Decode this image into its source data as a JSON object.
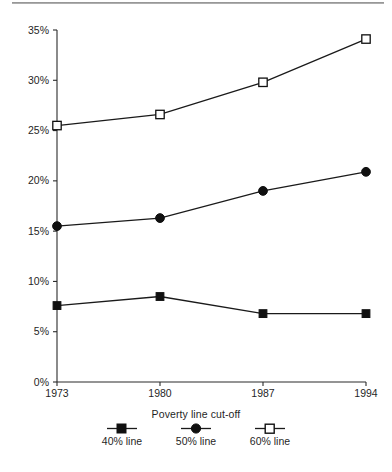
{
  "chart_data": {
    "type": "line",
    "title": "",
    "subtitle": "",
    "xlabel": "",
    "ylabel": "",
    "x": [
      1973,
      1980,
      1987,
      1994
    ],
    "categories": [
      "1973",
      "1980",
      "1987",
      "1994"
    ],
    "xtick_labels": [
      "1973",
      "1980",
      "1987",
      "1994"
    ],
    "ytick_labels": [
      "0%",
      "5%",
      "10%",
      "15%",
      "20%",
      "25%",
      "30%",
      "35%"
    ],
    "ytick_values": [
      0,
      5,
      10,
      15,
      20,
      25,
      30,
      35
    ],
    "ylim": [
      0,
      35
    ],
    "grid": false,
    "legend_position": "bottom",
    "legend_title": "Poverty line cut-off",
    "series": [
      {
        "name": "40% line",
        "marker": "filled-square",
        "values": [
          7.6,
          8.5,
          6.8,
          6.8
        ]
      },
      {
        "name": "50% line",
        "marker": "filled-circle",
        "values": [
          15.5,
          16.3,
          19.0,
          20.9
        ]
      },
      {
        "name": "60% line",
        "marker": "open-square",
        "values": [
          25.5,
          26.6,
          29.8,
          34.1
        ]
      }
    ],
    "colors": {
      "line": "#1a1a1a",
      "axis": "#2b2b2b",
      "marker_fill": "#101010",
      "marker_open_fill": "#ffffff",
      "background": "#ffffff",
      "rule": "#8c8c8c"
    }
  },
  "legend": {
    "title": "Poverty line cut-off",
    "items": [
      {
        "label": "40% line",
        "marker": "filled-square"
      },
      {
        "label": "50% line",
        "marker": "filled-circle"
      },
      {
        "label": "60% line",
        "marker": "open-square"
      }
    ]
  },
  "axes": {
    "y_ticks": [
      {
        "label": "35%"
      },
      {
        "label": "30%"
      },
      {
        "label": "25%"
      },
      {
        "label": "20%"
      },
      {
        "label": "15%"
      },
      {
        "label": "10%"
      },
      {
        "label": "5%"
      },
      {
        "label": "0%"
      }
    ],
    "x_ticks": [
      {
        "label": "1973"
      },
      {
        "label": "1980"
      },
      {
        "label": "1987"
      },
      {
        "label": "1994"
      }
    ]
  }
}
